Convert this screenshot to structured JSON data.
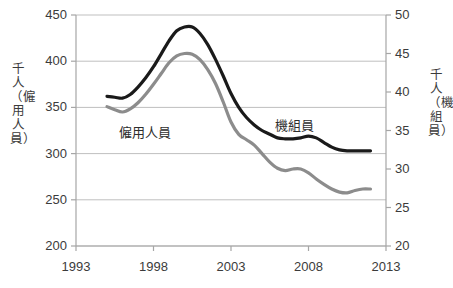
{
  "chart_data": {
    "type": "line",
    "title": "",
    "subtitle": "",
    "xlabel": "",
    "ylabel": "千人（僱用人員）",
    "ylabel_right": "千人（機組員）",
    "xlim": [
      1993,
      2013
    ],
    "ylim": [
      200,
      450
    ],
    "ylim_right": [
      20,
      50
    ],
    "grid": true,
    "grid_axis": "y",
    "legend": "inline-annotations",
    "x_ticks": [
      "1993",
      "1998",
      "2003",
      "2008",
      "2013"
    ],
    "x_tick_values": [
      1993,
      1998,
      2003,
      2008,
      2013
    ],
    "y_ticks_left": [
      "200",
      "250",
      "300",
      "350",
      "400",
      "450"
    ],
    "y_tick_values_left": [
      200,
      250,
      300,
      350,
      400,
      450
    ],
    "y_ticks_right": [
      "20",
      "25",
      "30",
      "35",
      "40",
      "45",
      "50"
    ],
    "y_tick_values_right": [
      20,
      25,
      30,
      35,
      40,
      45,
      50
    ],
    "series": [
      {
        "name": "僱用人員",
        "axis": "left",
        "color": "#1a1a1a",
        "width": 3.2,
        "x": [
          1995.0,
          1995.5,
          1996.0,
          1996.5,
          1997.0,
          1997.5,
          1998.0,
          1998.5,
          1999.0,
          1999.5,
          2000.0,
          2000.5,
          2001.0,
          2001.5,
          2002.0,
          2002.5,
          2003.0,
          2003.5,
          2004.0,
          2004.5,
          2005.0,
          2005.5,
          2006.0,
          2006.5,
          2007.0,
          2007.5,
          2008.0,
          2008.5,
          2009.0,
          2009.5,
          2010.0,
          2010.5,
          2011.0,
          2011.5,
          2012.0
        ],
        "values": [
          362,
          361,
          360,
          364,
          372,
          382,
          394,
          408,
          422,
          433,
          437,
          437,
          430,
          418,
          402,
          384,
          365,
          350,
          339,
          331,
          325,
          321,
          317,
          316,
          316,
          317,
          319,
          317,
          312,
          307,
          304,
          303,
          303,
          303,
          303
        ]
      },
      {
        "name": "機組員",
        "axis": "right",
        "color": "#8c8c8c",
        "width": 3.2,
        "x": [
          1995.0,
          1995.5,
          1996.0,
          1996.5,
          1997.0,
          1997.5,
          1998.0,
          1998.5,
          1999.0,
          1999.5,
          2000.0,
          2000.5,
          2001.0,
          2001.5,
          2002.0,
          2002.5,
          2003.0,
          2003.5,
          2004.0,
          2004.5,
          2005.0,
          2005.5,
          2006.0,
          2006.5,
          2007.0,
          2007.5,
          2008.0,
          2008.5,
          2009.0,
          2009.5,
          2010.0,
          2010.5,
          2011.0,
          2011.5,
          2012.0
        ],
        "values": [
          38.1,
          37.7,
          37.4,
          37.8,
          38.6,
          39.7,
          41.0,
          42.4,
          43.8,
          44.7,
          45.0,
          44.9,
          44.2,
          42.9,
          41.1,
          38.7,
          36.1,
          34.5,
          33.8,
          33.1,
          32.0,
          30.9,
          30.1,
          29.8,
          30.0,
          30.0,
          29.5,
          28.7,
          28.0,
          27.4,
          27.0,
          26.9,
          27.2,
          27.4,
          27.4
        ]
      }
    ],
    "annotations": [
      {
        "text": "僱用人員",
        "x": 1997.6,
        "y_left": 322,
        "series": "僱用人員"
      },
      {
        "text": "機組員",
        "x": 2007.2,
        "y_left": 330,
        "series": "機組員"
      }
    ]
  },
  "axes": {
    "left_title": "千人（僱用人員）",
    "right_title": "千人（機組員）"
  },
  "colors": {
    "employed_line": "#1a1a1a",
    "crew_line": "#8c8c8c",
    "grid": "#bfbfbf",
    "axis": "#a6a6a6",
    "text": "#3b3b3b",
    "background": "#ffffff"
  }
}
